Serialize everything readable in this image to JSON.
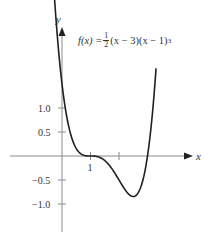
{
  "chart_data": {
    "type": "line",
    "function": {
      "label_prefix": "f(x) =",
      "frac_num": "1",
      "frac_den": "2",
      "label_rest": "(x − 3)(x − 1)",
      "exponent": "3"
    },
    "xlabel": "x",
    "ylabel": "y",
    "x_ticks": [
      {
        "value": 1,
        "label": "1"
      },
      {
        "value": 2,
        "label": ""
      }
    ],
    "y_ticks": [
      {
        "value": 1.0,
        "label": "1.0"
      },
      {
        "value": 0.5,
        "label": "0.5"
      },
      {
        "value": -0.5,
        "label": "−0.5"
      },
      {
        "value": -1.0,
        "label": "−1.0"
      }
    ],
    "xlim": [
      -2.1,
      4.8
    ],
    "ylim": [
      -1.8,
      3.0
    ],
    "grid": false,
    "series": [
      {
        "name": "f(x)",
        "x": [
          -0.35,
          -0.2,
          0,
          0.25,
          0.5,
          0.75,
          1,
          1.25,
          1.5,
          1.75,
          2,
          2.25,
          2.5,
          2.75,
          3,
          3.15,
          3.3
        ],
        "y": [
          2.76,
          2.07,
          1.5,
          0.58,
          0.16,
          0.02,
          0,
          -0.03,
          -0.19,
          -0.53,
          -0.5,
          -0.73,
          -0.84,
          -0.66,
          0,
          0.54,
          1.4
        ]
      }
    ],
    "notable_points": {
      "y_intercept": 1.5,
      "zeros": [
        1,
        3
      ],
      "minimum": {
        "x": 2.5,
        "y": -0.84
      }
    },
    "colors": {
      "curve": "#1f1f1f",
      "axes": "#8a8a8a"
    }
  }
}
